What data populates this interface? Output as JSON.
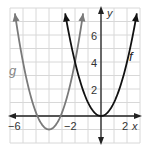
{
  "chart_data": {
    "type": "line",
    "title": "",
    "xlabel": "x",
    "ylabel": "y",
    "xlim": [
      -7,
      3
    ],
    "ylim": [
      -2,
      8
    ],
    "grid": true,
    "x_tick_labels": [
      "-6",
      "-2",
      "2"
    ],
    "y_tick_labels": [
      "2",
      "4",
      "6"
    ],
    "series": [
      {
        "name": "f",
        "equation": "y = x^2",
        "vertex": [
          0,
          0
        ],
        "color": "#111111"
      },
      {
        "name": "g",
        "equation": "y = 1.25(x + 4)^2 - 1",
        "vertex": [
          -4,
          -1
        ],
        "color": "#777777"
      }
    ],
    "annotations": [
      "f",
      "g"
    ]
  },
  "labels": {
    "x_axis": "x",
    "y_axis": "y",
    "f": "f",
    "g": "g",
    "xt1": "−6",
    "xt2": "−2",
    "xt3": "2",
    "yt1": "2",
    "yt2": "4",
    "yt3": "6"
  }
}
